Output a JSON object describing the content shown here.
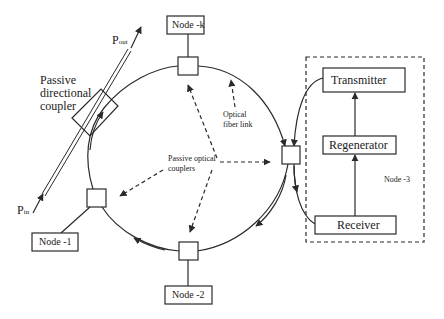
{
  "diagram": {
    "type": "optical ring network",
    "nodes": [
      {
        "id": "node-k",
        "label": "Node -k"
      },
      {
        "id": "node-1",
        "label": "Node -1"
      },
      {
        "id": "node-2",
        "label": "Node -2"
      },
      {
        "id": "node-3",
        "label": "Node -3"
      }
    ],
    "node3_blocks": {
      "transmitter": "Transmitter",
      "regenerator": "Regenerator",
      "receiver": "Receiver"
    },
    "labels": {
      "p_out_main": "P",
      "p_out_sub": "out",
      "p_in_main": "P",
      "p_in_sub": "in",
      "directional_coupler_line1": "Passive",
      "directional_coupler_line2": "directional",
      "directional_coupler_line3": "coupler",
      "optical_fiber_line1": "Optical",
      "optical_fiber_line2": "fiber link",
      "passive_couplers_line1": "Passive optical",
      "passive_couplers_line2": "couplers"
    },
    "colors": {
      "stroke": "#2a2a2a",
      "background": "#ffffff"
    }
  }
}
